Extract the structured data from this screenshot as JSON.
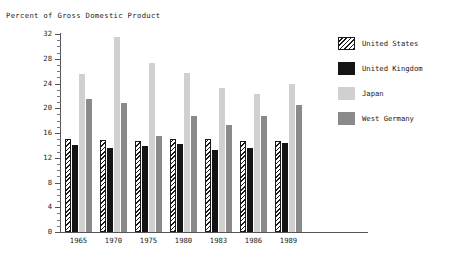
{
  "chart_data": {
    "type": "bar",
    "title": "",
    "ylabel": "Percent of Gross Domestic Product",
    "xlabel": "",
    "ylim": [
      0,
      32
    ],
    "ytick_step": 4,
    "grid": false,
    "legend_position": "right",
    "categories": [
      "1965",
      "1970",
      "1975",
      "1980",
      "1983",
      "1986",
      "1989"
    ],
    "yticks": [
      "0",
      "4",
      "8",
      "12",
      "16",
      "20",
      "24",
      "28",
      "32"
    ],
    "series": [
      {
        "name": "United States",
        "color": "#ffffff",
        "pattern": "diagonal-hatch",
        "values": [
          15.1,
          14.8,
          14.7,
          15.0,
          15.0,
          14.7,
          14.7
        ]
      },
      {
        "name": "United Kingdom",
        "color": "#141414",
        "pattern": "solid",
        "values": [
          14.0,
          13.6,
          13.9,
          14.3,
          13.2,
          13.6,
          14.4
        ]
      },
      {
        "name": "Japan",
        "color": "#d0d0d0",
        "pattern": "solid",
        "values": [
          25.5,
          31.5,
          27.3,
          25.7,
          23.2,
          22.3,
          24.0
        ]
      },
      {
        "name": "West Germany",
        "color": "#8a8a8a",
        "pattern": "solid",
        "values": [
          21.5,
          20.8,
          15.5,
          18.8,
          17.3,
          18.7,
          20.6
        ]
      }
    ]
  },
  "legend": {
    "items": [
      {
        "label": "United States"
      },
      {
        "label": "United Kingdom"
      },
      {
        "label": "Japan"
      },
      {
        "label": "West Germany"
      }
    ]
  }
}
